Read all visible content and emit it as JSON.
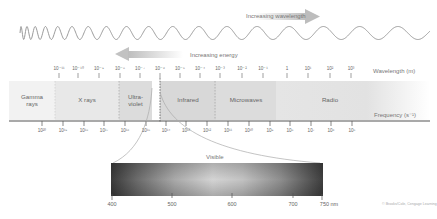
{
  "wave": {
    "wavelength_arrow_label": "Increasing wavelength",
    "energy_arrow_label": "Increasing energy"
  },
  "spectrum": {
    "wavelength_axis_label": "Wavelength (m)",
    "frequency_axis_label": "Frequency (s⁻¹)",
    "wavelength_ticks": [
      "10⁻¹¹",
      "10⁻¹⁰",
      "10⁻⁹",
      "10⁻⁸",
      "10⁻⁷",
      "10⁻⁶",
      "10⁻⁵",
      "10⁻⁴",
      "10⁻³",
      "10⁻²",
      "10⁻¹",
      "1",
      "10¹",
      "10²",
      "10³"
    ],
    "frequency_ticks": [
      "10²⁰",
      "10¹⁹",
      "10¹⁸",
      "10¹⁷",
      "10¹⁶",
      "10¹⁵",
      "10¹⁴",
      "10¹³",
      "10¹²",
      "10¹¹",
      "10¹⁰",
      "10⁹",
      "10⁸",
      "10⁷",
      "10⁶",
      "10⁵"
    ],
    "bands": [
      {
        "label_line1": "Gamma",
        "label_line2": "rays"
      },
      {
        "label_line1": "X rays",
        "label_line2": ""
      },
      {
        "label_line1": "Ultra-",
        "label_line2": "violet"
      },
      {
        "label_line1": "Infrared",
        "label_line2": ""
      },
      {
        "label_line1": "Microwaves",
        "label_line2": ""
      },
      {
        "label_line1": "Radio",
        "label_line2": ""
      }
    ]
  },
  "visible": {
    "title": "Visible",
    "ticks": [
      "400",
      "500",
      "600",
      "700",
      "750 nm"
    ]
  },
  "credit": "© Brooks/Cole, Cengage Learning",
  "colors": {
    "band_light": "#ececec",
    "band_mid": "#d9d9d9",
    "axis": "#555555",
    "wave": "#aaaaaa"
  }
}
